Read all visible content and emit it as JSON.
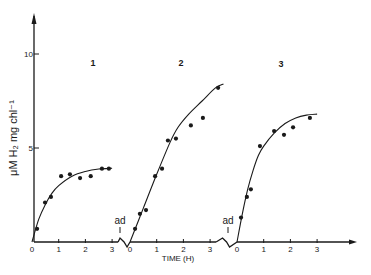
{
  "chart_data": {
    "type": "scatter",
    "title": "",
    "xlabel": "TIME (H)",
    "ylabel": "μM H₂ mg chl⁻¹",
    "ylim": [
      0,
      12
    ],
    "yticks": [
      {
        "value": 5,
        "label": "5"
      },
      {
        "value": 10,
        "label": "10"
      }
    ],
    "y_origin_label": "0",
    "grid": false,
    "legend": "none",
    "break_annotation": "ad",
    "panels": [
      {
        "name": "1",
        "x_ticks": [
          "0",
          "1",
          "2",
          "3"
        ],
        "xlim": [
          0,
          3
        ],
        "points": [
          {
            "t": 0.19,
            "y": 0.7
          },
          {
            "t": 0.49,
            "y": 2.1
          },
          {
            "t": 0.71,
            "y": 2.4
          },
          {
            "t": 1.09,
            "y": 3.5
          },
          {
            "t": 1.42,
            "y": 3.6
          },
          {
            "t": 1.8,
            "y": 3.4
          },
          {
            "t": 2.2,
            "y": 3.5
          },
          {
            "t": 2.62,
            "y": 3.9
          },
          {
            "t": 2.88,
            "y": 3.9
          }
        ],
        "fit_curve": [
          [
            0,
            0
          ],
          [
            0.25,
            1.2
          ],
          [
            0.5,
            2.0
          ],
          [
            0.75,
            2.6
          ],
          [
            1.0,
            3.0
          ],
          [
            1.5,
            3.5
          ],
          [
            2.0,
            3.75
          ],
          [
            2.5,
            3.88
          ],
          [
            3.0,
            3.92
          ]
        ]
      },
      {
        "name": "2",
        "x_ticks": [
          "0",
          "1",
          "2",
          "3"
        ],
        "xlim": [
          0,
          3.5
        ],
        "points": [
          {
            "t": 0.19,
            "y": 0.7
          },
          {
            "t": 0.37,
            "y": 1.5
          },
          {
            "t": 0.6,
            "y": 1.7
          },
          {
            "t": 0.94,
            "y": 3.5
          },
          {
            "t": 1.2,
            "y": 3.9
          },
          {
            "t": 1.42,
            "y": 5.4
          },
          {
            "t": 1.72,
            "y": 5.5
          },
          {
            "t": 2.28,
            "y": 6.2
          },
          {
            "t": 2.73,
            "y": 6.6
          },
          {
            "t": 3.3,
            "y": 8.2
          }
        ],
        "fit_curve": [
          [
            0,
            0
          ],
          [
            0.5,
            1.8
          ],
          [
            1.0,
            3.6
          ],
          [
            1.5,
            5.3
          ],
          [
            1.8,
            6.1
          ],
          [
            2.2,
            6.8
          ],
          [
            2.7,
            7.5
          ],
          [
            3.2,
            8.2
          ],
          [
            3.5,
            8.4
          ]
        ]
      },
      {
        "name": "3",
        "x_ticks": [
          "0",
          "1",
          "2",
          "3"
        ],
        "xlim": [
          0,
          3
        ],
        "points": [
          {
            "t": 0.15,
            "y": 1.3
          },
          {
            "t": 0.37,
            "y": 2.4
          },
          {
            "t": 0.52,
            "y": 2.8
          },
          {
            "t": 0.86,
            "y": 5.1
          },
          {
            "t": 1.39,
            "y": 5.9
          },
          {
            "t": 1.76,
            "y": 5.7
          },
          {
            "t": 2.1,
            "y": 6.1
          },
          {
            "t": 2.73,
            "y": 6.6
          }
        ],
        "fit_curve": [
          [
            0,
            0
          ],
          [
            0.2,
            1.5
          ],
          [
            0.4,
            2.8
          ],
          [
            0.6,
            3.8
          ],
          [
            0.8,
            4.6
          ],
          [
            1.0,
            5.1
          ],
          [
            1.4,
            5.8
          ],
          [
            1.8,
            6.3
          ],
          [
            2.2,
            6.6
          ],
          [
            2.6,
            6.75
          ],
          [
            3.0,
            6.8
          ]
        ]
      }
    ]
  },
  "layout": {
    "y_axis_x": 34,
    "baseline_y": 242,
    "px_per_unit_y": 18.8,
    "px_per_hour": 26.7,
    "panel_origins_x": [
      32,
      130,
      237
    ],
    "panel_label_pos": [
      [
        93,
        66
      ],
      [
        181,
        66
      ],
      [
        281,
        67
      ]
    ],
    "ad_pos": [
      [
        120,
        224
      ],
      [
        228,
        224
      ]
    ],
    "x_axis_end": 357
  }
}
